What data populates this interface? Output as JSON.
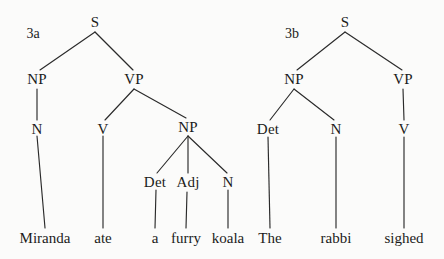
{
  "figure": {
    "type": "constituency-syntax-trees",
    "background_color": "#fbfbfa",
    "line_color": "#2a2a2a",
    "text_color": "#1b1b1b",
    "width": 444,
    "height": 259
  },
  "trees": [
    {
      "label": "3a",
      "label_pos": {
        "x": 33,
        "y": 34
      },
      "sentence": "Miranda ate a furry koala",
      "nodes": [
        {
          "id": "a-s",
          "text": "S",
          "x": 95,
          "y": 22,
          "kind": "category"
        },
        {
          "id": "a-np1",
          "text": "NP",
          "x": 37,
          "y": 79,
          "kind": "category"
        },
        {
          "id": "a-vp",
          "text": "VP",
          "x": 134,
          "y": 79,
          "kind": "category"
        },
        {
          "id": "a-n1",
          "text": "N",
          "x": 37,
          "y": 129,
          "kind": "category"
        },
        {
          "id": "a-v",
          "text": "V",
          "x": 103,
          "y": 129,
          "kind": "category"
        },
        {
          "id": "a-np2",
          "text": "NP",
          "x": 188,
          "y": 127,
          "kind": "category"
        },
        {
          "id": "a-det",
          "text": "Det",
          "x": 155,
          "y": 182,
          "kind": "category"
        },
        {
          "id": "a-adj",
          "text": "Adj",
          "x": 188,
          "y": 182,
          "kind": "category"
        },
        {
          "id": "a-n2",
          "text": "N",
          "x": 228,
          "y": 182,
          "kind": "category"
        },
        {
          "id": "a-w1",
          "text": "Miranda",
          "x": 45,
          "y": 238,
          "kind": "leaf"
        },
        {
          "id": "a-w2",
          "text": "ate",
          "x": 103,
          "y": 238,
          "kind": "leaf"
        },
        {
          "id": "a-w3",
          "text": "a",
          "x": 155,
          "y": 238,
          "kind": "leaf"
        },
        {
          "id": "a-w4",
          "text": "furry",
          "x": 186,
          "y": 238,
          "kind": "leaf"
        },
        {
          "id": "a-w5",
          "text": "koala",
          "x": 228,
          "y": 238,
          "kind": "leaf"
        }
      ],
      "edges": [
        {
          "x1": 95,
          "y1": 32,
          "x2": 40,
          "y2": 70
        },
        {
          "x1": 95,
          "y1": 32,
          "x2": 133,
          "y2": 70
        },
        {
          "x1": 37,
          "y1": 89,
          "x2": 37,
          "y2": 120
        },
        {
          "x1": 134,
          "y1": 89,
          "x2": 105,
          "y2": 120
        },
        {
          "x1": 134,
          "y1": 89,
          "x2": 186,
          "y2": 118
        },
        {
          "x1": 37,
          "y1": 136,
          "x2": 45,
          "y2": 228
        },
        {
          "x1": 103,
          "y1": 136,
          "x2": 103,
          "y2": 228
        },
        {
          "x1": 188,
          "y1": 136,
          "x2": 157,
          "y2": 173
        },
        {
          "x1": 188,
          "y1": 136,
          "x2": 188,
          "y2": 173
        },
        {
          "x1": 188,
          "y1": 136,
          "x2": 227,
          "y2": 173
        },
        {
          "x1": 156,
          "y1": 190,
          "x2": 155,
          "y2": 228
        },
        {
          "x1": 187,
          "y1": 192,
          "x2": 186,
          "y2": 228
        },
        {
          "x1": 228,
          "y1": 190,
          "x2": 228,
          "y2": 228
        }
      ]
    },
    {
      "label": "3b",
      "label_pos": {
        "x": 292,
        "y": 34
      },
      "sentence": "The rabbi sighed",
      "nodes": [
        {
          "id": "b-s",
          "text": "S",
          "x": 345,
          "y": 22,
          "kind": "category"
        },
        {
          "id": "b-np",
          "text": "NP",
          "x": 294,
          "y": 79,
          "kind": "category"
        },
        {
          "id": "b-vp",
          "text": "VP",
          "x": 403,
          "y": 79,
          "kind": "category"
        },
        {
          "id": "b-det",
          "text": "Det",
          "x": 268,
          "y": 129,
          "kind": "category"
        },
        {
          "id": "b-n",
          "text": "N",
          "x": 336,
          "y": 129,
          "kind": "category"
        },
        {
          "id": "b-v",
          "text": "V",
          "x": 404,
          "y": 129,
          "kind": "category"
        },
        {
          "id": "b-w1",
          "text": "The",
          "x": 270,
          "y": 238,
          "kind": "leaf"
        },
        {
          "id": "b-w2",
          "text": "rabbi",
          "x": 336,
          "y": 238,
          "kind": "leaf"
        },
        {
          "id": "b-w3",
          "text": "sighed",
          "x": 404,
          "y": 238,
          "kind": "leaf"
        }
      ],
      "edges": [
        {
          "x1": 345,
          "y1": 32,
          "x2": 297,
          "y2": 70
        },
        {
          "x1": 345,
          "y1": 32,
          "x2": 402,
          "y2": 70
        },
        {
          "x1": 294,
          "y1": 89,
          "x2": 270,
          "y2": 120
        },
        {
          "x1": 294,
          "y1": 89,
          "x2": 334,
          "y2": 120
        },
        {
          "x1": 403,
          "y1": 89,
          "x2": 404,
          "y2": 120
        },
        {
          "x1": 268,
          "y1": 137,
          "x2": 270,
          "y2": 228
        },
        {
          "x1": 336,
          "y1": 137,
          "x2": 336,
          "y2": 228
        },
        {
          "x1": 404,
          "y1": 137,
          "x2": 404,
          "y2": 228
        }
      ]
    }
  ]
}
